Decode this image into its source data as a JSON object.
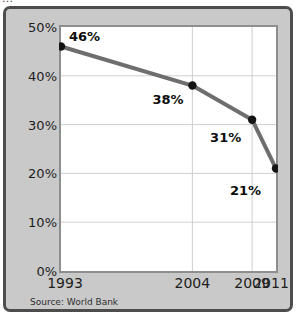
{
  "figure": {
    "clipped_top_text": "…",
    "source_note": "Source: World Bank",
    "colors": {
      "frame_border": "#4d4d4d",
      "frame_background": "#c9c9c9",
      "plot_background": "#ffffff",
      "plot_border": "#8e8e8e",
      "gridline": "#cfcfcf",
      "line": "#6e6e6e",
      "marker": "#141414",
      "text": "#1d1d1d"
    }
  },
  "chart_data": {
    "type": "line",
    "title": "",
    "subtitle": "",
    "xlabel": "",
    "ylabel": "",
    "x": [
      1993,
      2004,
      2009,
      2011
    ],
    "categories": [
      "1993",
      "2004",
      "2009",
      "2011"
    ],
    "values": [
      46,
      38,
      31,
      21
    ],
    "point_labels": [
      "46%",
      "38%",
      "31%",
      "21%"
    ],
    "series": [
      {
        "name": "Poverty rate",
        "values": [
          46,
          38,
          31,
          21
        ]
      }
    ],
    "ylim": [
      0,
      50
    ],
    "xlim": [
      1993,
      2011
    ],
    "yticks": [
      0,
      10,
      20,
      30,
      40,
      50
    ],
    "ytick_labels": [
      "0%",
      "10%",
      "20%",
      "30%",
      "40%",
      "50%"
    ],
    "xticks": [
      1993,
      2004,
      2009,
      2011
    ],
    "xtick_labels": [
      "1993",
      "2004",
      "2009",
      "2011"
    ],
    "grid": {
      "horizontal": true,
      "vertical": true,
      "horizontal_at": [
        10,
        20,
        30,
        40
      ],
      "vertical_at": [
        2004,
        2009
      ]
    },
    "legend": null,
    "legend_position": "none",
    "annotations": [
      "Source: World Bank"
    ]
  }
}
